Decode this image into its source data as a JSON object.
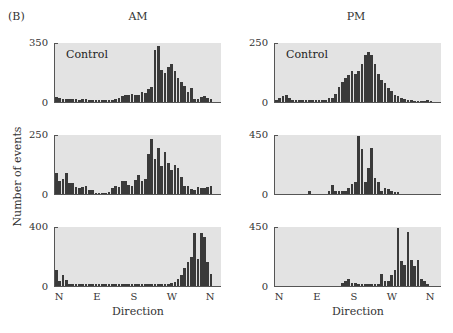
{
  "figure": {
    "panel_label": "(B)",
    "column_titles": [
      "AM",
      "PM"
    ],
    "ylabel": "Number of events",
    "xlabel": "Direction",
    "xticks": [
      "N",
      "E",
      "S",
      "W",
      "N"
    ],
    "plot_note": "Control",
    "colors": {
      "background": "#ffffff",
      "plot_fill": "#e3e3e3",
      "bar": "#3a3a3a",
      "axis": "#555555"
    }
  },
  "chart_data": [
    {
      "type": "bar",
      "title": "AM – Control",
      "position": "row1-left",
      "annotation": "Control",
      "xlabel": "Direction",
      "ylabel": "Number of events",
      "xticks": [
        "N",
        "E",
        "S",
        "W",
        "N"
      ],
      "ylim": [
        0,
        350
      ],
      "yticks": [
        0,
        350
      ],
      "bins": 48,
      "values": [
        28,
        22,
        20,
        18,
        20,
        16,
        18,
        14,
        18,
        16,
        12,
        12,
        12,
        12,
        12,
        12,
        12,
        12,
        20,
        25,
        35,
        40,
        40,
        45,
        42,
        40,
        60,
        55,
        75,
        90,
        310,
        330,
        190,
        170,
        210,
        225,
        185,
        140,
        120,
        95,
        60,
        85,
        20,
        20,
        30,
        35,
        25,
        18
      ]
    },
    {
      "type": "bar",
      "title": "PM – Control",
      "position": "row1-right",
      "annotation": "Control",
      "xlabel": "Direction",
      "ylabel": "Number of events",
      "xticks": [
        "N",
        "E",
        "S",
        "W",
        "N"
      ],
      "ylim": [
        0,
        250
      ],
      "yticks": [
        0,
        250
      ],
      "bins": 48,
      "values": [
        8,
        18,
        25,
        28,
        15,
        10,
        8,
        10,
        8,
        8,
        8,
        8,
        8,
        8,
        8,
        8,
        15,
        15,
        35,
        65,
        85,
        100,
        115,
        130,
        120,
        130,
        160,
        200,
        210,
        200,
        160,
        120,
        95,
        80,
        60,
        45,
        30,
        25,
        15,
        12,
        10,
        10,
        5,
        5,
        5,
        5,
        8,
        5
      ]
    },
    {
      "type": "bar",
      "title": "AM – Row 2",
      "position": "row2-left",
      "xlabel": "Direction",
      "ylabel": "Number of events",
      "xticks": [
        "N",
        "E",
        "S",
        "W",
        "N"
      ],
      "ylim": [
        0,
        250
      ],
      "yticks": [
        0,
        250
      ],
      "bins": 48,
      "values": [
        90,
        55,
        65,
        90,
        45,
        45,
        30,
        25,
        30,
        35,
        15,
        15,
        5,
        5,
        5,
        5,
        10,
        25,
        35,
        30,
        55,
        55,
        40,
        35,
        60,
        80,
        55,
        65,
        170,
        235,
        150,
        195,
        120,
        180,
        130,
        100,
        125,
        110,
        70,
        35,
        35,
        20,
        15,
        30,
        25,
        25,
        30,
        35,
        55,
        40,
        45
      ]
    },
    {
      "type": "bar",
      "title": "PM – Row 2",
      "position": "row2-right",
      "xlabel": "Direction",
      "ylabel": "Number of events",
      "xticks": [
        "N",
        "E",
        "S",
        "W",
        "N"
      ],
      "ylim": [
        0,
        450
      ],
      "yticks": [
        0,
        450
      ],
      "bins": 48,
      "values": [
        0,
        0,
        0,
        0,
        0,
        0,
        0,
        0,
        0,
        0,
        20,
        0,
        0,
        0,
        0,
        0,
        20,
        70,
        20,
        20,
        20,
        20,
        45,
        80,
        95,
        440,
        340,
        90,
        200,
        350,
        120,
        95,
        25,
        45,
        40,
        25,
        15,
        15,
        0,
        0,
        0,
        0,
        0,
        0,
        0,
        0,
        0,
        0
      ]
    },
    {
      "type": "bar",
      "title": "AM – Row 3",
      "position": "row3-left",
      "xlabel": "Direction",
      "ylabel": "Number of events",
      "xticks": [
        "N",
        "E",
        "S",
        "W",
        "N"
      ],
      "ylim": [
        0,
        400
      ],
      "yticks": [
        0,
        400
      ],
      "bins": 48,
      "values": [
        110,
        35,
        75,
        40,
        15,
        15,
        15,
        15,
        15,
        15,
        15,
        15,
        15,
        15,
        15,
        15,
        15,
        15,
        15,
        15,
        15,
        15,
        15,
        15,
        15,
        15,
        15,
        15,
        15,
        15,
        15,
        15,
        15,
        15,
        15,
        20,
        30,
        50,
        75,
        120,
        160,
        200,
        360,
        180,
        360,
        330,
        160,
        80
      ]
    },
    {
      "type": "bar",
      "title": "PM – Row 3",
      "position": "row3-right",
      "xlabel": "Direction",
      "ylabel": "Number of events",
      "xticks": [
        "N",
        "E",
        "S",
        "W",
        "N"
      ],
      "ylim": [
        0,
        450
      ],
      "yticks": [
        0,
        450
      ],
      "bins": 48,
      "values": [
        0,
        0,
        0,
        0,
        0,
        0,
        0,
        0,
        0,
        0,
        0,
        0,
        0,
        0,
        0,
        0,
        0,
        0,
        0,
        0,
        20,
        40,
        55,
        25,
        20,
        15,
        12,
        12,
        12,
        12,
        12,
        12,
        90,
        40,
        40,
        85,
        120,
        440,
        190,
        160,
        410,
        200,
        150,
        200,
        50,
        35,
        15,
        0
      ]
    }
  ]
}
